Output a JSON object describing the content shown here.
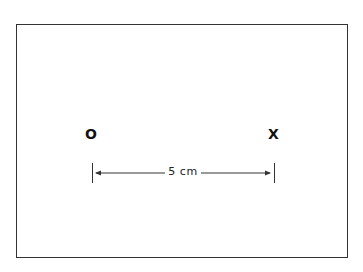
{
  "diagram": {
    "points": [
      {
        "label": "O"
      },
      {
        "label": "X"
      }
    ],
    "dimension": {
      "label": "5 cm",
      "from": "O",
      "to": "X"
    },
    "colors": {
      "line": "#333333",
      "text": "#111111",
      "background": "#ffffff"
    }
  }
}
